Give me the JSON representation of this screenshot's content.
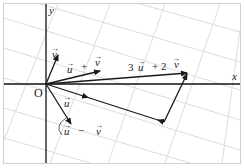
{
  "diagram": {
    "type": "vector-diagram",
    "axes": {
      "x_label": "x",
      "y_label": "y",
      "origin_label": "O"
    },
    "vectors": [
      {
        "id": "v",
        "label": "v",
        "from": [
          46,
          84
        ],
        "to": [
          58,
          54
        ]
      },
      {
        "id": "u_plus_v",
        "label": "u + v",
        "from": [
          46,
          84
        ],
        "to": [
          100,
          71
        ]
      },
      {
        "id": "3u_plus_2v",
        "label": "3 u + 2 v",
        "from": [
          46,
          84
        ],
        "to": [
          187,
          73
        ]
      },
      {
        "id": "u",
        "label": "u",
        "from": [
          46,
          84
        ],
        "to": [
          86,
          97
        ]
      },
      {
        "id": "u_minus_v",
        "label": "u − v",
        "from": [
          46,
          84
        ],
        "to": [
          72,
          125
        ]
      }
    ],
    "labels": {
      "y": "y",
      "x": "x",
      "O": "O",
      "v_arrow": "→",
      "v": "v",
      "upv_u": "u",
      "upv_plus": "+",
      "upv_v": "v",
      "big_3": "3",
      "big_u": "u",
      "big_plus": "+ 2",
      "big_v": "v",
      "u": "u",
      "umv_u": "u",
      "umv_minus": "−",
      "umv_v": "v"
    },
    "colors": {
      "axis": "#111111",
      "vector": "#1a1a1a",
      "grid": "#dcdcdc",
      "border": "#d0d0d0"
    }
  }
}
